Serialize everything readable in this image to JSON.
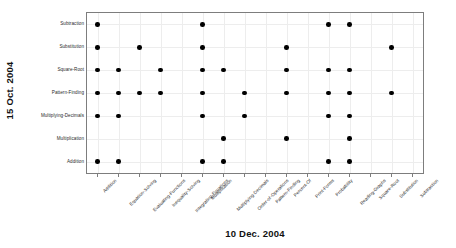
{
  "chart_data": {
    "type": "scatter",
    "title": "",
    "xlabel": "10 Dec. 2004",
    "ylabel": "15 Oct. 2004",
    "grid": true,
    "legend": "none",
    "marker": "filled-circle",
    "marker_color": "#000000",
    "x_categories": [
      "Addition",
      "Equation-Solving",
      "Evaluating-Functions",
      "Inequality-Solving",
      "Integrating-Equations",
      "Multiplication",
      "Multiplying-Decimals",
      "Order-of-Operations",
      "Pattern-Finding",
      "Percent-Of",
      "Print-Forms",
      "Probability",
      "Reading-Graphs",
      "Square-Root",
      "Substitution",
      "Subtraction"
    ],
    "y_categories": [
      "Addition",
      "Multiplication",
      "Multiplying-Decimals",
      "Pattern-Finding",
      "Square-Root",
      "Substitution",
      "Subtraction"
    ],
    "y_categories_top_to_bottom": [
      "Subtraction",
      "Substitution",
      "Square-Root",
      "Pattern-Finding",
      "Multiplying-Decimals",
      "Multiplication",
      "Addition"
    ],
    "points": [
      {
        "x": "Addition",
        "y": "Subtraction"
      },
      {
        "x": "Multiplication",
        "y": "Subtraction"
      },
      {
        "x": "Probability",
        "y": "Subtraction"
      },
      {
        "x": "Reading-Graphs",
        "y": "Subtraction"
      },
      {
        "x": "Addition",
        "y": "Substitution"
      },
      {
        "x": "Evaluating-Functions",
        "y": "Substitution"
      },
      {
        "x": "Multiplication",
        "y": "Substitution"
      },
      {
        "x": "Percent-Of",
        "y": "Substitution"
      },
      {
        "x": "Substitution",
        "y": "Substitution"
      },
      {
        "x": "Addition",
        "y": "Square-Root"
      },
      {
        "x": "Equation-Solving",
        "y": "Square-Root"
      },
      {
        "x": "Inequality-Solving",
        "y": "Square-Root"
      },
      {
        "x": "Multiplication",
        "y": "Square-Root"
      },
      {
        "x": "Multiplying-Decimals",
        "y": "Square-Root"
      },
      {
        "x": "Percent-Of",
        "y": "Square-Root"
      },
      {
        "x": "Probability",
        "y": "Square-Root"
      },
      {
        "x": "Reading-Graphs",
        "y": "Square-Root"
      },
      {
        "x": "Addition",
        "y": "Pattern-Finding"
      },
      {
        "x": "Equation-Solving",
        "y": "Pattern-Finding"
      },
      {
        "x": "Evaluating-Functions",
        "y": "Pattern-Finding"
      },
      {
        "x": "Inequality-Solving",
        "y": "Pattern-Finding"
      },
      {
        "x": "Multiplication",
        "y": "Pattern-Finding"
      },
      {
        "x": "Order-of-Operations",
        "y": "Pattern-Finding"
      },
      {
        "x": "Percent-Of",
        "y": "Pattern-Finding"
      },
      {
        "x": "Probability",
        "y": "Pattern-Finding"
      },
      {
        "x": "Reading-Graphs",
        "y": "Pattern-Finding"
      },
      {
        "x": "Substitution",
        "y": "Pattern-Finding"
      },
      {
        "x": "Addition",
        "y": "Multiplying-Decimals"
      },
      {
        "x": "Equation-Solving",
        "y": "Multiplying-Decimals"
      },
      {
        "x": "Multiplication",
        "y": "Multiplying-Decimals"
      },
      {
        "x": "Order-of-Operations",
        "y": "Multiplying-Decimals"
      },
      {
        "x": "Probability",
        "y": "Multiplying-Decimals"
      },
      {
        "x": "Reading-Graphs",
        "y": "Multiplying-Decimals"
      },
      {
        "x": "Multiplying-Decimals",
        "y": "Multiplication"
      },
      {
        "x": "Percent-Of",
        "y": "Multiplication"
      },
      {
        "x": "Reading-Graphs",
        "y": "Multiplication"
      },
      {
        "x": "Addition",
        "y": "Addition"
      },
      {
        "x": "Equation-Solving",
        "y": "Addition"
      },
      {
        "x": "Multiplication",
        "y": "Addition"
      },
      {
        "x": "Multiplying-Decimals",
        "y": "Addition"
      },
      {
        "x": "Probability",
        "y": "Addition"
      },
      {
        "x": "Reading-Graphs",
        "y": "Addition"
      }
    ]
  }
}
